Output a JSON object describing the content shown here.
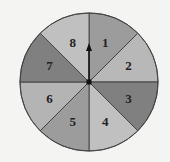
{
  "spinner": {
    "center": [
      89,
      82
    ],
    "radius": 69,
    "pointer_direction": "up",
    "sectors": [
      {
        "label": "1",
        "color": "#9c9c9c"
      },
      {
        "label": "2",
        "color": "#b8b8b8"
      },
      {
        "label": "3",
        "color": "#808080"
      },
      {
        "label": "4",
        "color": "#c0c0c0"
      },
      {
        "label": "5",
        "color": "#9c9c9c"
      },
      {
        "label": "6",
        "color": "#b4b4b4"
      },
      {
        "label": "7",
        "color": "#808080"
      },
      {
        "label": "8",
        "color": "#c0c0c0"
      }
    ]
  }
}
